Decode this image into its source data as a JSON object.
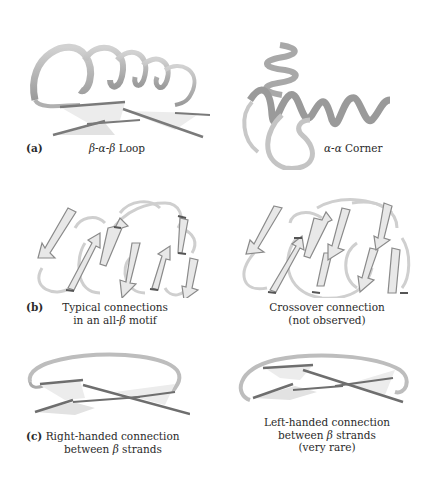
{
  "figure": {
    "panels": {
      "a": {
        "tag": "(a)",
        "left_caption": {
          "prefix_italic": "β-α-β",
          "suffix": " Loop"
        },
        "right_caption": {
          "prefix_italic": "α-α",
          "suffix": " Corner"
        }
      },
      "b": {
        "tag": "(b)",
        "left_caption": {
          "line1": "Typical connections",
          "line2_prefix": "in an all-",
          "line2_italic": "β",
          "line2_suffix": " motif"
        },
        "right_caption": {
          "line1": "Crossover connection",
          "line2": "(not observed)"
        }
      },
      "c": {
        "tag": "(c)",
        "left_caption": {
          "line1": "Right-handed connection",
          "line2_prefix": "between ",
          "line2_italic": "β",
          "line2_suffix": " strands"
        },
        "right_caption": {
          "line1": "Left-handed connection",
          "line2_prefix": "between ",
          "line2_italic": "β",
          "line2_suffix": " strands",
          "line3": "(very rare)"
        }
      }
    },
    "colors": {
      "ribbon": "#b8b8b8",
      "ribbon_dark": "#8a8a8a",
      "strand_face": "#e6e6e6",
      "strand_edge": "#7a7a7a",
      "text": "#2a2a2a"
    }
  }
}
